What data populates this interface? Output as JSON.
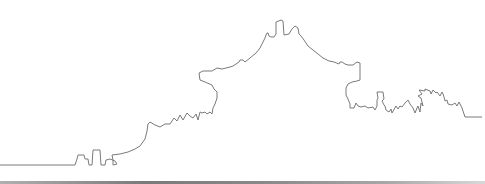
{
  "illustration": {
    "description": "Outline silhouette skyline line drawing",
    "stroke_color": "#7a7a7a",
    "background_color": "#ffffff",
    "stroke_width": 1,
    "outline_points": "0,165 75,165 77,159 78,155 84,155 85,159 88,159 89,165 92,165 93,150 100,150 101,165 105,165 106,160 110,159 115,161 117,164 113,165 113,160 112,155 120,154 128,152 135,149 140,146 145,139 147,131 148,124 150,122 155,125 160,127 165,124 170,124 174,118 177,121 180,115 183,120 187,113 190,116 193,118 196,114 198,120 200,112 202,113 205,112 207,114 210,112 212,114 213,108 215,104 217,98 217,92 214,89 212,85 205,82 200,80 199,73 203,71 212,71 217,68 222,69 230,67 233,66 239,62 240,60 243,60 245,62 250,58 256,53 260,48 263,42 265,38 266,35 267,33 268,33 269,36 271,37 274,37 276,34 276,22 281,20 283,21 284,35 289,34 292,29 295,26 298,28 299,34 301,36 304,40 308,46 313,50 318,54 323,58 329,61 334,62 339,64 340,62 342,62 345,64 348,65 353,65 357,62 360,63 360,80 357,81 352,82 348,84 346,88 346,95 348,99 350,104 350,108 354,108 356,103 358,106 361,107 365,106 368,108 373,107 375,110 377,106 377,100 378,98 377,92 383,92 384,99 382,101 384,105 385,106 386,110 389,112 391,109 392,113 396,106 398,109 400,106 402,107 405,103 408,100 410,104 413,108 415,113 417,108 418,106 420,112 421,103 423,106 421,98 418,96 422,94 419,90 425,91 425,89 430,91 431,94 433,90 436,93 437,92 440,96 442,92 443,94 444,97 445,101 447,100 448,104 452,105 455,103 457,106 459,102 462,108 465,117 482,117",
    "baseline_y": 165,
    "bottom_border": {
      "gradient_stops": [
        "#b0b0b0",
        "#7a7a7a",
        "#8a8a8a",
        "#a8a8a8",
        "#d8d8d8"
      ]
    }
  }
}
